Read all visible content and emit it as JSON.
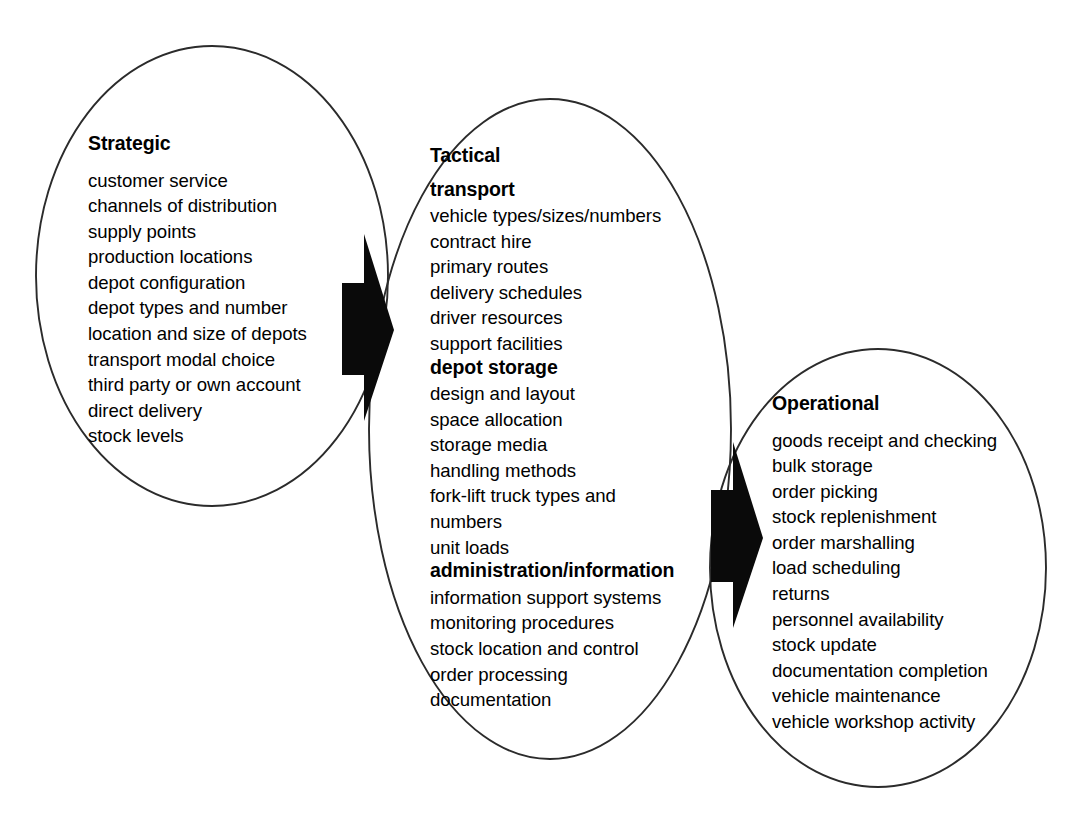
{
  "diagram": {
    "line_color": "#2b2b2b",
    "arrow_color": "#0a0a0a",
    "groups": [
      {
        "id": "strategic",
        "title": "Strategic",
        "sections": [
          {
            "heading": null,
            "items": [
              "customer service",
              "channels of distribution",
              "supply points",
              "production locations",
              "depot configuration",
              "depot types and number",
              "location and size of depots",
              "transport modal choice",
              "third party or own account",
              "direct delivery",
              "stock levels"
            ]
          }
        ]
      },
      {
        "id": "tactical",
        "title": "Tactical",
        "sections": [
          {
            "heading": "transport",
            "items": [
              "vehicle types/sizes/numbers",
              "contract hire",
              "primary routes",
              "delivery schedules",
              "driver resources",
              "support facilities"
            ]
          },
          {
            "heading": "depot storage",
            "items": [
              "design and layout",
              "space allocation",
              "storage media",
              "handling methods",
              "fork-lift truck types and",
              "numbers",
              "unit loads"
            ]
          },
          {
            "heading": "administration/information",
            "items": [
              "information support systems",
              "monitoring procedures",
              "stock location and control",
              "order processing",
              "documentation"
            ]
          }
        ]
      },
      {
        "id": "operational",
        "title": "Operational",
        "sections": [
          {
            "heading": null,
            "items": [
              "goods receipt and checking",
              "bulk storage",
              "order picking",
              "stock replenishment",
              "order marshalling",
              "load scheduling",
              "returns",
              "personnel availability",
              "stock update",
              "documentation completion",
              "vehicle maintenance",
              "vehicle workshop activity"
            ]
          }
        ]
      }
    ],
    "arrows": [
      {
        "id": "strategic-to-tactical",
        "label": "arrow from Strategic to Tactical"
      },
      {
        "id": "tactical-to-operational",
        "label": "arrow from Tactical to Operational"
      }
    ]
  }
}
